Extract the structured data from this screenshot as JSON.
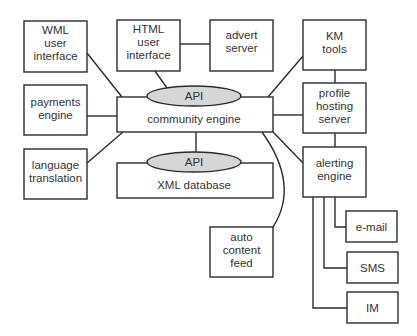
{
  "diagram": {
    "nodes": [
      {
        "id": "wml",
        "lines": [
          "WML",
          "user",
          "interface"
        ]
      },
      {
        "id": "html",
        "lines": [
          "HTML",
          "user",
          "interface"
        ]
      },
      {
        "id": "advert",
        "lines": [
          "advert",
          "server"
        ]
      },
      {
        "id": "km",
        "lines": [
          "KM",
          "tools"
        ]
      },
      {
        "id": "payments",
        "lines": [
          "payments",
          "engine"
        ]
      },
      {
        "id": "community",
        "lines": [
          "community engine"
        ],
        "api_label": "API"
      },
      {
        "id": "profile",
        "lines": [
          "profile",
          "hosting",
          "server"
        ]
      },
      {
        "id": "language",
        "lines": [
          "language",
          "translation"
        ]
      },
      {
        "id": "xmldb",
        "lines": [
          "XML database"
        ],
        "api_label": "API"
      },
      {
        "id": "alerting",
        "lines": [
          "alerting",
          "engine"
        ]
      },
      {
        "id": "autofeed",
        "lines": [
          "auto",
          "content",
          "feed"
        ]
      },
      {
        "id": "email",
        "lines": [
          "e-mail"
        ]
      },
      {
        "id": "sms",
        "lines": [
          "SMS"
        ]
      },
      {
        "id": "im",
        "lines": [
          "IM"
        ]
      }
    ],
    "edges": [
      [
        "wml",
        "community"
      ],
      [
        "html",
        "community"
      ],
      [
        "html",
        "advert"
      ],
      [
        "km",
        "community"
      ],
      [
        "payments",
        "community"
      ],
      [
        "profile",
        "community"
      ],
      [
        "language",
        "community"
      ],
      [
        "community",
        "xmldb"
      ],
      [
        "community",
        "alerting"
      ],
      [
        "community",
        "autofeed"
      ],
      [
        "km",
        "profile"
      ],
      [
        "profile",
        "alerting"
      ],
      [
        "alerting",
        "email"
      ],
      [
        "alerting",
        "sms"
      ],
      [
        "alerting",
        "im"
      ]
    ]
  }
}
